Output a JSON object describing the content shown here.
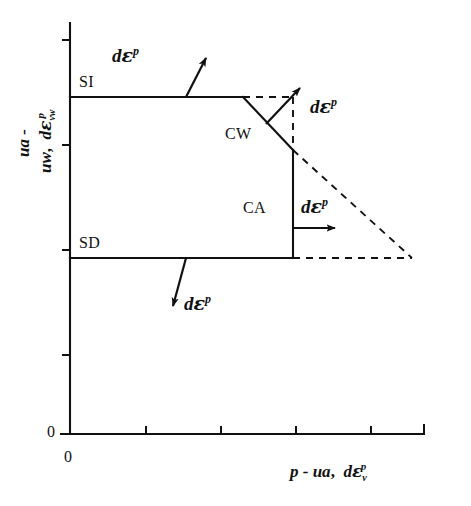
{
  "figure": {
    "type": "diagram",
    "caption_present": false,
    "background_color": "#ffffff",
    "line_color": "#111111"
  },
  "axes": {
    "x": {
      "label_parts": {
        "stress": "p - ua",
        "separator": ",",
        "strain_d": "d",
        "strain_eps": "ε",
        "strain_sub": "v",
        "strain_sup": "p"
      },
      "label_text": "p - ua ,  dεvᵖ",
      "origin_label": "0",
      "tick_count": 5,
      "start_px": 70,
      "end_px": 425,
      "y_px": 434,
      "ticks_px": [
        146,
        221,
        296,
        371,
        425
      ]
    },
    "y": {
      "label_parts": {
        "suction": "ua - uw",
        "separator": ",",
        "strain_d": "d",
        "strain_eps": "ε",
        "strain_sub": "vw",
        "strain_sup": "p"
      },
      "label_text": "ua - uw ,  dεvwᵖ",
      "origin_label": "0",
      "tick_count": 4,
      "top_px": 22,
      "bottom_px": 434,
      "x_px": 70,
      "ticks_px": [
        40,
        145,
        250,
        355
      ]
    }
  },
  "yield_surface": {
    "solid_segments": [
      {
        "name": "SI-line",
        "from": [
          70,
          97
        ],
        "to": [
          243,
          97
        ]
      },
      {
        "name": "CW-diagonal",
        "from": [
          243,
          97
        ],
        "to": [
          293,
          150
        ]
      },
      {
        "name": "CA-right-edge",
        "from": [
          293,
          150
        ],
        "to": [
          293,
          258
        ]
      },
      {
        "name": "SD-line",
        "from": [
          70,
          258
        ],
        "to": [
          293,
          258
        ]
      }
    ],
    "dashed_segments": [
      {
        "name": "expanded-SI",
        "from": [
          243,
          97
        ],
        "to": [
          293,
          97
        ]
      },
      {
        "name": "expanded-vertical",
        "from": [
          293,
          97
        ],
        "to": [
          293,
          150
        ]
      },
      {
        "name": "expanded-diagonal",
        "from": [
          293,
          150
        ],
        "to": [
          412,
          258
        ]
      },
      {
        "name": "expanded-SD",
        "from": [
          293,
          258
        ],
        "to": [
          412,
          258
        ]
      }
    ]
  },
  "region_labels": [
    {
      "id": "SI",
      "text": "SI",
      "x": 79,
      "y": 80
    },
    {
      "id": "SD",
      "text": "SD",
      "x": 79,
      "y": 241
    },
    {
      "id": "CW",
      "text": "CW",
      "x": 226,
      "y": 133
    },
    {
      "id": "CA",
      "text": "CA",
      "x": 244,
      "y": 207
    }
  ],
  "strain_vectors": [
    {
      "id": "SI-increment",
      "label": {
        "d": "d",
        "eps": "ε",
        "sup": "p"
      },
      "label_x": 113,
      "label_y": 52,
      "tail": [
        186,
        97
      ],
      "head": [
        206,
        53
      ]
    },
    {
      "id": "CW-increment",
      "label": {
        "d": "d",
        "eps": "ε",
        "sup": "p"
      },
      "label_x": 310,
      "label_y": 104,
      "tail": [
        266,
        124
      ],
      "head": [
        303,
        84
      ]
    },
    {
      "id": "CA-increment",
      "label": {
        "d": "d",
        "eps": "ε",
        "sup": "p"
      },
      "label_x": 302,
      "label_y": 203,
      "tail": [
        293,
        228
      ],
      "head": [
        340,
        228
      ]
    },
    {
      "id": "SD-increment",
      "label": {
        "d": "d",
        "eps": "ε",
        "sup": "p"
      },
      "label_x": 185,
      "label_y": 300,
      "tail": [
        186,
        258
      ],
      "head": [
        171,
        312
      ]
    }
  ]
}
